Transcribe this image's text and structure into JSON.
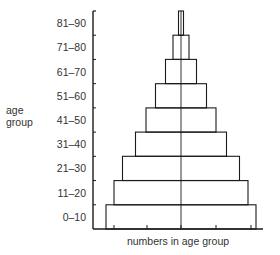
{
  "chart_data": {
    "type": "bar",
    "subtype": "population-pyramid",
    "title": "",
    "xlabel": "numbers in age group",
    "ylabel": "age group",
    "categories": [
      "0–10",
      "11–20",
      "21–30",
      "31–40",
      "41–50",
      "51–60",
      "61–70",
      "71–80",
      "81–90"
    ],
    "values": [
      150,
      134,
      117,
      91,
      70,
      51,
      31,
      16,
      5
    ],
    "value_units": "relative (total bar width, symmetric about center axis)",
    "orientation": "horizontal",
    "centered": true,
    "x_ticks": 5,
    "grid": false,
    "legend": null
  },
  "labels": {
    "y_title_line1": "age",
    "y_title_line2": "group",
    "x_title": "numbers in age group"
  },
  "colors": {
    "line": "#1a1a1a",
    "text": "#333333",
    "background": "#ffffff"
  }
}
